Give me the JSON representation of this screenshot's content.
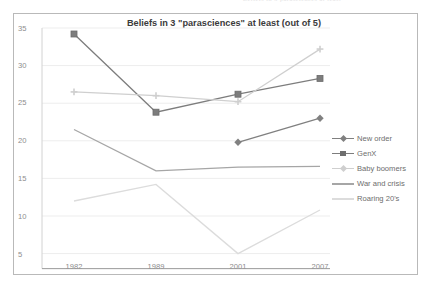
{
  "page": {
    "top_ghost_text": "Beliefs in 3 parasciences at least"
  },
  "chart_data": {
    "type": "line",
    "title": "Beliefs  in 3 \"parasciences\" at least (out of 5)",
    "xlabel": "",
    "ylabel": "",
    "categories": [
      "1982",
      "1989",
      "2001",
      "2007"
    ],
    "x_tick_labels": [
      "1982",
      "1989",
      "2001",
      "2007"
    ],
    "y_tick_labels": [
      "35",
      "30",
      "25",
      "20",
      "15",
      "10",
      "5"
    ],
    "ylim": [
      3,
      35
    ],
    "xlim": [
      0,
      3
    ],
    "grid": true,
    "legend_position": "right",
    "series": [
      {
        "name": "New order",
        "color": "#808080",
        "marker": "diamond",
        "values": [
          null,
          null,
          19.8,
          23.0
        ]
      },
      {
        "name": "GenX",
        "color": "#7d7d7d",
        "marker": "square",
        "values": [
          34.2,
          23.8,
          26.2,
          28.3
        ]
      },
      {
        "name": "Baby boomers",
        "color": "#cfcfcf",
        "marker": "cross",
        "values": [
          26.5,
          26.0,
          25.2,
          32.2
        ]
      },
      {
        "name": "War and crisis",
        "color": "#a6a6a6",
        "marker": "none",
        "values": [
          21.5,
          16.0,
          16.5,
          16.6
        ]
      },
      {
        "name": "Roaring 20's",
        "color": "#dcdcdc",
        "marker": "none",
        "values": [
          12.0,
          14.2,
          5.0,
          10.8
        ]
      }
    ]
  }
}
